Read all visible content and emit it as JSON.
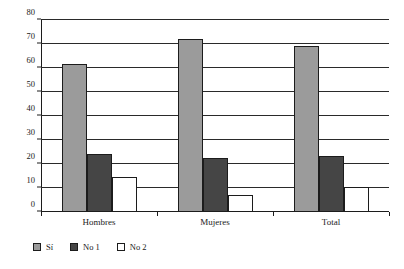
{
  "chart_data": {
    "type": "bar",
    "title": "",
    "subtitle": "",
    "xlabel": "",
    "ylabel": "",
    "categories": [
      "Hombres",
      "Mujeres",
      "Total"
    ],
    "series": [
      {
        "name": "Sí",
        "color": "#9b9b9b",
        "values": [
          61.5,
          72.0,
          69.0
        ]
      },
      {
        "name": "No 1",
        "color": "#454545",
        "values": [
          24.0,
          22.5,
          23.5
        ]
      },
      {
        "name": "No 2",
        "color": "#ffffff",
        "values": [
          14.5,
          7.0,
          10.5
        ]
      }
    ],
    "ylim": [
      0,
      80
    ],
    "ytick_labels": [
      "0",
      "10",
      "20",
      "30",
      "40",
      "50",
      "60",
      "70",
      "80"
    ],
    "ytick_values": [
      0,
      10,
      20,
      30,
      40,
      50,
      60,
      70,
      80
    ],
    "grid": true,
    "legend_position": "bottom-left",
    "legend_entries": [
      "Sí",
      "No 1",
      "No 2"
    ]
  },
  "colors": {
    "series_si": "#9b9b9b",
    "series_no1": "#454545",
    "series_no2": "#ffffff",
    "axis": "#1c1c1c",
    "grid": "#2a2a2a",
    "background": "#ffffff",
    "text": "#1a1a1a"
  }
}
